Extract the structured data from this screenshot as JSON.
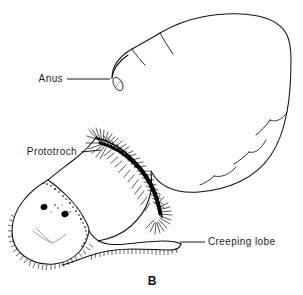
{
  "figure": {
    "caption_letter": "B",
    "background_color": "#ffffff",
    "ink_color": "#111111"
  },
  "labels": [
    {
      "id": "anus",
      "text": "Anus",
      "text_x": 63,
      "text_y": 82,
      "leader": {
        "x1": 92,
        "y1": 79,
        "x2": 112,
        "y2": 79
      },
      "target": "anal-pore"
    },
    {
      "id": "prototroch",
      "text": "Prototroch",
      "text_x": 21,
      "text_y": 155,
      "leader": {
        "x1": 79,
        "y1": 152,
        "x2": 99,
        "y2": 152
      },
      "target": "ciliary-band"
    },
    {
      "id": "creeping-lobe",
      "text": "Creeping lobe",
      "text_x": 208,
      "text_y": 245,
      "leader": {
        "x1": 178,
        "y1": 241,
        "x2": 204,
        "y2": 241
      },
      "target": "creeping-lobe-margin"
    }
  ],
  "anatomy": {
    "body_lobes_count": 6,
    "eyespots_count": 2,
    "anal_pore_shape": "small elongated oval",
    "prototroch_description": "dense curved band of cilia between head and body",
    "ventral_fringe_description": "fine cilia along ventral margin of head and creeping lobe"
  }
}
